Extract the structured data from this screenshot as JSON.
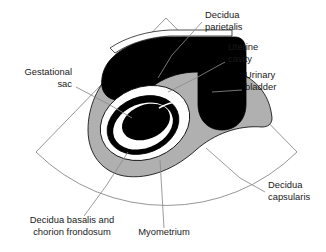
{
  "figure": {
    "type": "anatomical-line-diagram",
    "canvas": {
      "width": 326,
      "height": 252
    },
    "colors": {
      "background": "#ffffff",
      "myometrium_gray": "#b0b0b0",
      "fluid_black": "#000000",
      "outline": "#000000",
      "fan_outline": "#8a8a8a",
      "leader_line": "#8a8a8a",
      "text": "#1a1a1a",
      "white": "#ffffff"
    },
    "scan_fan": {
      "apex_x": 166,
      "apex_y": 18,
      "left_corner_x": 36,
      "left_corner_y": 152,
      "right_corner_x": 297,
      "right_corner_y": 152,
      "arc_bottom_y": 216
    }
  },
  "labels": [
    {
      "id": "decidua-parietalis",
      "lines": [
        "Decidua",
        "parietalis"
      ],
      "anchor": "start",
      "text_x": 205,
      "text_y": 18,
      "leader": [
        [
          202,
          22
        ],
        [
          172,
          55
        ],
        [
          158,
          78
        ]
      ]
    },
    {
      "id": "uterine-cavity",
      "lines": [
        "Uterine",
        "cavity"
      ],
      "anchor": "start",
      "text_x": 228,
      "text_y": 50,
      "leader": [
        [
          225,
          62
        ],
        [
          196,
          78
        ],
        [
          168,
          92
        ]
      ]
    },
    {
      "id": "urinary-bladder",
      "lines": [
        "Urinary",
        "bladder"
      ],
      "anchor": "start",
      "text_x": 245,
      "text_y": 78,
      "leader": [
        [
          242,
          90
        ],
        [
          212,
          92
        ]
      ]
    },
    {
      "id": "gestational-sac",
      "lines": [
        "Gestational",
        "sac"
      ],
      "anchor": "end",
      "text_x": 72,
      "text_y": 75,
      "leader": [
        [
          76,
          87
        ],
        [
          110,
          105
        ],
        [
          132,
          118
        ]
      ]
    },
    {
      "id": "decidua-capsularis",
      "lines": [
        "Decidua",
        "capsularis"
      ],
      "anchor": "start",
      "text_x": 268,
      "text_y": 188,
      "leader": [
        [
          265,
          192
        ],
        [
          240,
          178
        ],
        [
          206,
          148
        ]
      ]
    },
    {
      "id": "decidua-basalis-chorion-frondosum",
      "lines": [
        "Decidua basalis and",
        "chorion frondosum"
      ],
      "anchor": "middle",
      "text_x": 72,
      "text_y": 223,
      "leader": [
        [
          84,
          216
        ],
        [
          106,
          186
        ],
        [
          128,
          152
        ]
      ]
    },
    {
      "id": "myometrium",
      "lines": [
        "Myometrium"
      ],
      "anchor": "middle",
      "text_x": 164,
      "text_y": 235,
      "leader": [
        [
          164,
          228
        ],
        [
          160,
          160
        ]
      ]
    }
  ],
  "structures": [
    {
      "id": "myometrium-body",
      "name": "Myometrium",
      "fill": "myometrium_gray"
    },
    {
      "id": "urinary-bladder-body",
      "name": "Urinary bladder",
      "fill": "fluid_black"
    },
    {
      "id": "uterine-cavity-body",
      "name": "Uterine cavity",
      "fill": "fluid_black"
    },
    {
      "id": "decidua-parietalis-band",
      "name": "Decidua parietalis",
      "fill": "white"
    },
    {
      "id": "decidua-capsularis-ring",
      "name": "Decidua capsularis",
      "fill": "white"
    },
    {
      "id": "decidua-basalis-ring",
      "name": "Decidua basalis and chorion frondosum",
      "fill": "outline"
    },
    {
      "id": "gestational-sac-cavity",
      "name": "Gestational sac",
      "fill": "fluid_black"
    }
  ]
}
